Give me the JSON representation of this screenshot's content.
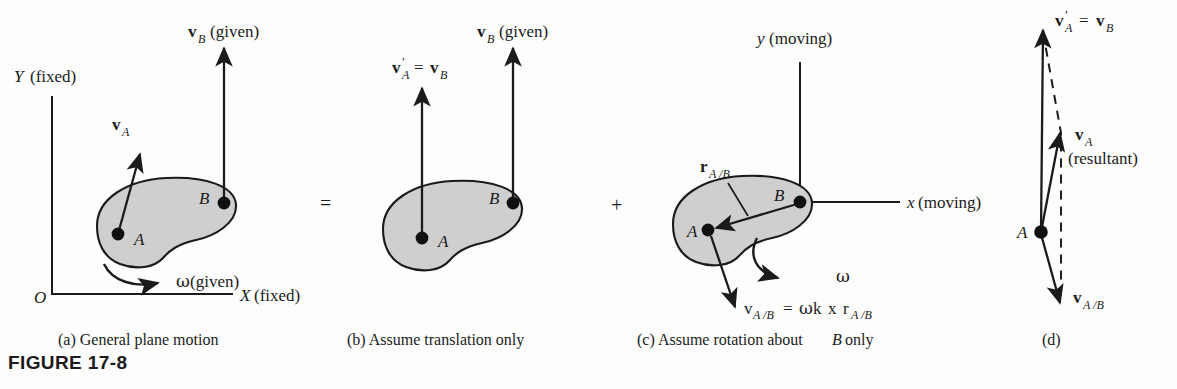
{
  "figure": {
    "number_label": "FIGURE 17-8",
    "background_color": "#fdfdfd",
    "body_fill_color": "#cfcfcf",
    "ink_color": "#1b1b1b"
  },
  "operators": {
    "equals": "=",
    "plus": "+"
  },
  "panels": [
    {
      "id": "a",
      "caption": "(a)  General plane motion",
      "axes": {
        "y_label_letter": "Y",
        "y_label_paren": "(fixed)",
        "x_label_letter": "X",
        "x_label_paren": "(fixed)",
        "origin_label": "O"
      },
      "points": [
        {
          "label": "A"
        },
        {
          "label": "B"
        }
      ],
      "vectors": [
        {
          "symbol": "v",
          "subscript": "A",
          "note": ""
        },
        {
          "symbol": "v",
          "subscript": "B",
          "note": "(given)"
        }
      ],
      "omega": {
        "symbol": "ω",
        "note": "(given)"
      }
    },
    {
      "id": "b",
      "caption": "(b)  Assume translation only",
      "points": [
        {
          "label": "A"
        },
        {
          "label": "B"
        }
      ],
      "vectors": [
        {
          "symbol": "v",
          "subscript": "A",
          "prime": true,
          "equals": "=",
          "rhs_symbol": "v",
          "rhs_subscript": "B"
        },
        {
          "symbol": "v",
          "subscript": "B",
          "note": "(given)"
        }
      ]
    },
    {
      "id": "c",
      "caption": "(c)  Assume rotation about B only",
      "caption_parts": {
        "lead": "(c)  Assume rotation about",
        "italic_letter": "B",
        "tail": "only"
      },
      "axes": {
        "y_label_letter": "y",
        "y_label_paren": "(moving)",
        "x_label_letter": "x",
        "x_label_paren": "(moving)"
      },
      "points": [
        {
          "label": "A"
        },
        {
          "label": "B"
        }
      ],
      "vectors": [
        {
          "symbol": "r",
          "subscript": "A /B"
        }
      ],
      "omega": {
        "symbol": "ω",
        "note": ""
      },
      "equation": {
        "lhs_symbol": "v",
        "lhs_subscript": "A /B",
        "equals": "=",
        "rhs_greek": "ω",
        "rhs_k": "k",
        "cross": "x",
        "rhs_r": "r",
        "rhs_r_subscript": "A /B"
      }
    },
    {
      "id": "d",
      "caption": "(d)",
      "points": [
        {
          "label": "A"
        }
      ],
      "vectors": [
        {
          "symbol": "v",
          "subscript": "A",
          "prime": true,
          "equals": "=",
          "rhs_symbol": "v",
          "rhs_subscript": "B"
        },
        {
          "symbol": "v",
          "subscript": "A",
          "note": "(resultant)"
        },
        {
          "symbol": "v",
          "subscript": "A /B",
          "note": ""
        }
      ]
    }
  ]
}
